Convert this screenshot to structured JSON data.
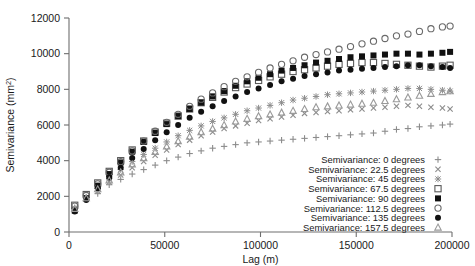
{
  "chart_data": {
    "type": "scatter",
    "title": "",
    "xlabel": "Lag (m)",
    "ylabel": "Semivariance (mm2)",
    "ylabel_base": "Semivariance (mm",
    "ylabel_sup": "2",
    "ylabel_close": ")",
    "xlim": [
      0,
      200000
    ],
    "ylim": [
      0,
      12000
    ],
    "xticks": [
      0,
      50000,
      100000,
      150000,
      200000
    ],
    "xtick_labels": [
      "0",
      "50000",
      "100000",
      "150000",
      "200000"
    ],
    "yticks": [
      0,
      2000,
      4000,
      6000,
      8000,
      10000,
      12000
    ],
    "ytick_labels": [
      "0",
      "2000",
      "4000",
      "6000",
      "8000",
      "10000",
      "12000"
    ],
    "grid": false,
    "legend_position": "bottom-right",
    "x": [
      3000,
      9000,
      15000,
      21000,
      27000,
      33000,
      39000,
      45000,
      51000,
      57000,
      63000,
      69000,
      75000,
      81000,
      87000,
      93000,
      99000,
      105000,
      111000,
      117000,
      123000,
      129000,
      135000,
      141000,
      147000,
      153000,
      159000,
      165000,
      171000,
      177000,
      183000,
      189000,
      195000,
      199000
    ],
    "series": [
      {
        "name": "Semivariance: 0 degrees",
        "marker": "plus",
        "color": "#8c8c8c",
        "values": [
          1250,
          1800,
          2150,
          2650,
          2950,
          3250,
          3500,
          3750,
          4000,
          4200,
          4400,
          4550,
          4700,
          4800,
          4900,
          5000,
          5050,
          5100,
          5150,
          5200,
          5250,
          5300,
          5350,
          5400,
          5450,
          5500,
          5550,
          5650,
          5750,
          5800,
          5900,
          5950,
          6000,
          6050
        ]
      },
      {
        "name": "Semivariance: 22.5 degrees",
        "marker": "x",
        "color": "#8c8c8c",
        "values": [
          1300,
          1850,
          2300,
          2800,
          3200,
          3600,
          3950,
          4300,
          4600,
          4900,
          5150,
          5400,
          5600,
          5800,
          5950,
          6100,
          6250,
          6350,
          6450,
          6550,
          6650,
          6700,
          6750,
          6800,
          6850,
          6900,
          6950,
          7000,
          7050,
          7100,
          7050,
          7000,
          6950,
          6900
        ]
      },
      {
        "name": "Semivariance: 45 degrees",
        "marker": "star",
        "color": "#8c8c8c",
        "values": [
          1350,
          1950,
          2450,
          3000,
          3500,
          3950,
          4350,
          4700,
          5050,
          5400,
          5700,
          5950,
          6200,
          6400,
          6600,
          6800,
          6950,
          7100,
          7250,
          7400,
          7500,
          7600,
          7700,
          7750,
          7800,
          7850,
          7900,
          7950,
          8000,
          8050,
          8050,
          8000,
          7950,
          7900
        ]
      },
      {
        "name": "Semivariance: 67.5 degrees",
        "marker": "open-square",
        "color": "#5a5a5a",
        "values": [
          1500,
          2100,
          2750,
          3400,
          4000,
          4600,
          5100,
          5600,
          6100,
          6500,
          6900,
          7250,
          7550,
          7850,
          8100,
          8300,
          8500,
          8700,
          8850,
          9000,
          9100,
          9200,
          9300,
          9400,
          9450,
          9500,
          9500,
          9450,
          9400,
          9350,
          9300,
          9250,
          9300,
          9350
        ]
      },
      {
        "name": "Semivariance: 90 degrees",
        "marker": "filled-square",
        "color": "#111111",
        "values": [
          1200,
          1900,
          2600,
          3250,
          3900,
          4500,
          5050,
          5550,
          6050,
          6500,
          6900,
          7250,
          7600,
          7900,
          8200,
          8450,
          8650,
          8850,
          9050,
          9200,
          9350,
          9500,
          9600,
          9700,
          9800,
          9850,
          9900,
          9950,
          10000,
          10000,
          9950,
          10000,
          10050,
          10100
        ]
      },
      {
        "name": "Semivariance: 112.5 degrees",
        "marker": "open-circle",
        "color": "#6a6a6a",
        "values": [
          1450,
          2050,
          2700,
          3350,
          3950,
          4550,
          5100,
          5650,
          6150,
          6600,
          7050,
          7450,
          7800,
          8150,
          8450,
          8700,
          8950,
          9200,
          9400,
          9600,
          9800,
          9950,
          10100,
          10250,
          10400,
          10550,
          10700,
          10850,
          11000,
          11100,
          11250,
          11400,
          11500,
          11550
        ]
      },
      {
        "name": "Semivariance: 135 degrees",
        "marker": "filled-circle",
        "color": "#111111",
        "values": [
          1150,
          1800,
          2450,
          3050,
          3600,
          4150,
          4650,
          5150,
          5600,
          6000,
          6400,
          6750,
          7050,
          7350,
          7600,
          7850,
          8050,
          8250,
          8450,
          8600,
          8750,
          8850,
          8950,
          9050,
          9100,
          9150,
          9200,
          9250,
          9300,
          9350,
          9350,
          9300,
          9250,
          9200
        ]
      },
      {
        "name": "Semivariance: 157.5 degrees",
        "marker": "open-triangle",
        "color": "#9a9a9a",
        "values": [
          1300,
          1900,
          2400,
          2900,
          3350,
          3800,
          4150,
          4500,
          4800,
          5100,
          5350,
          5600,
          5800,
          6000,
          6200,
          6350,
          6500,
          6600,
          6700,
          6800,
          6900,
          7000,
          7050,
          7100,
          7150,
          7200,
          7250,
          7350,
          7450,
          7550,
          7650,
          7750,
          7850,
          7900
        ]
      }
    ]
  }
}
